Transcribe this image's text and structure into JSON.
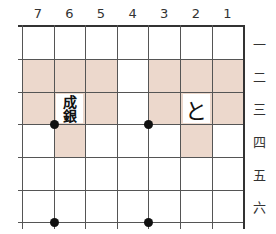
{
  "board": {
    "files": [
      "7",
      "6",
      "5",
      "4",
      "3",
      "2",
      "1"
    ],
    "ranks": [
      "一",
      "二",
      "三",
      "四",
      "五",
      "六"
    ],
    "shade_color": "#ecd8cc",
    "shaded_cells": [
      {
        "file": "7",
        "rank": "二"
      },
      {
        "file": "6",
        "rank": "二"
      },
      {
        "file": "5",
        "rank": "二"
      },
      {
        "file": "3",
        "rank": "二"
      },
      {
        "file": "2",
        "rank": "二"
      },
      {
        "file": "1",
        "rank": "二"
      },
      {
        "file": "7",
        "rank": "三"
      },
      {
        "file": "5",
        "rank": "三"
      },
      {
        "file": "3",
        "rank": "三"
      },
      {
        "file": "1",
        "rank": "三"
      },
      {
        "file": "6",
        "rank": "四"
      },
      {
        "file": "2",
        "rank": "四"
      }
    ],
    "pieces": [
      {
        "file": "6",
        "rank": "三",
        "line1": "成",
        "line2": "銀",
        "name": "narigin"
      },
      {
        "file": "2",
        "rank": "三",
        "label": "と",
        "name": "tokin"
      }
    ],
    "star_points": [
      {
        "between_files": "7-6",
        "between_ranks": "三-四"
      },
      {
        "between_files": "4-3",
        "between_ranks": "三-四"
      },
      {
        "between_files": "7-6",
        "below_rank": "六"
      },
      {
        "between_files": "4-3",
        "below_rank": "六"
      }
    ]
  }
}
